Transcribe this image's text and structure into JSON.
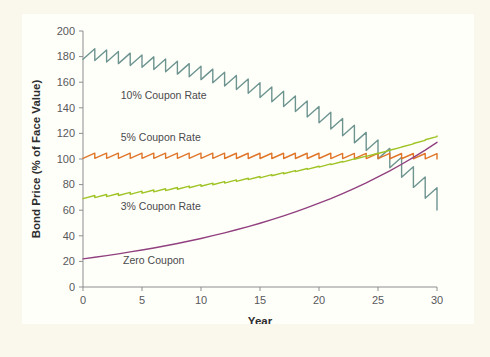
{
  "figure": {
    "background_color": "#faf8ec",
    "panel_color": "#fffffa"
  },
  "chart_data": {
    "type": "line",
    "title": "",
    "subtitle": "",
    "xlabel": "Year",
    "ylabel": "Bond Price (% of Face Value)",
    "xlim": [
      0,
      30
    ],
    "ylim": [
      0,
      200
    ],
    "xticks": [
      0,
      5,
      10,
      15,
      20,
      25,
      30
    ],
    "xtick_labels": [
      "0",
      "5",
      "10",
      "15",
      "20",
      "25",
      "30"
    ],
    "yticks": [
      0,
      20,
      40,
      60,
      80,
      100,
      120,
      140,
      160,
      180,
      200
    ],
    "ytick_labels": [
      "0",
      "20",
      "40",
      "60",
      "80",
      "100",
      "120",
      "140",
      "160",
      "180",
      "200"
    ],
    "grid": false,
    "legend_position": "inline-annotations",
    "annotations": [
      {
        "text": "10% Coupon Rate",
        "x": 3.2,
        "y": 147,
        "series": "10% Coupon Rate"
      },
      {
        "text": "5% Coupon Rate",
        "x": 3.2,
        "y": 114,
        "series": "5% Coupon Rate"
      },
      {
        "text": "3% Coupon Rate",
        "x": 3.2,
        "y": 60,
        "series": "3% Coupon Rate"
      },
      {
        "text": "Zero Coupon",
        "x": 3.4,
        "y": 18,
        "series": "Zero Coupon"
      }
    ],
    "note": "Market yield held constant; sawtooth reflects coupon accrual then drop on each annual coupon payment. All bonds converge to par (100) at maturity in year 30.",
    "market_yield_percent": 5.6,
    "series": [
      {
        "name": "10% Coupon Rate",
        "color": "#6e9490",
        "coupon_rate_percent": 10,
        "sawtooth": true,
        "x": [
          0,
          1,
          2,
          3,
          4,
          5,
          6,
          7,
          8,
          9,
          10,
          11,
          12,
          13,
          14,
          15,
          16,
          17,
          18,
          19,
          20,
          21,
          22,
          23,
          24,
          25,
          26,
          27,
          28,
          29,
          30
        ],
        "values": [
          178.0,
          177.0,
          175.8,
          174.5,
          173.1,
          171.6,
          169.9,
          168.2,
          166.3,
          164.2,
          162.0,
          159.6,
          157.0,
          154.3,
          151.3,
          148.1,
          144.7,
          141.0,
          137.1,
          132.8,
          128.3,
          123.4,
          118.2,
          112.6,
          106.6,
          100.1,
          93.2,
          85.8,
          77.8,
          69.3,
          60.1
        ]
      },
      {
        "name": "5% Coupon Rate",
        "color": "#e0762a",
        "coupon_rate_percent": 5,
        "sawtooth": true,
        "x": [
          0,
          1,
          2,
          3,
          4,
          5,
          6,
          7,
          8,
          9,
          10,
          11,
          12,
          13,
          14,
          15,
          16,
          17,
          18,
          19,
          20,
          21,
          22,
          23,
          24,
          25,
          26,
          27,
          28,
          29,
          30
        ],
        "values": [
          100.5,
          100.5,
          100.5,
          100.5,
          100.5,
          100.5,
          100.5,
          100.5,
          100.5,
          100.5,
          100.5,
          100.5,
          100.4,
          100.4,
          100.4,
          100.4,
          100.4,
          100.4,
          100.4,
          100.4,
          100.4,
          100.3,
          100.3,
          100.3,
          100.3,
          100.3,
          100.2,
          100.2,
          100.2,
          100.1,
          100.0
        ]
      },
      {
        "name": "3% Coupon Rate",
        "color": "#9fc425",
        "coupon_rate_percent": 3,
        "sawtooth": true,
        "x": [
          0,
          1,
          2,
          3,
          4,
          5,
          6,
          7,
          8,
          9,
          10,
          11,
          12,
          13,
          14,
          15,
          16,
          17,
          18,
          19,
          20,
          21,
          22,
          23,
          24,
          25,
          26,
          27,
          28,
          29,
          30
        ],
        "values": [
          69.0,
          69.8,
          70.6,
          71.5,
          72.4,
          73.3,
          74.3,
          75.3,
          76.4,
          77.5,
          78.7,
          79.9,
          81.2,
          82.5,
          83.9,
          85.3,
          86.9,
          88.5,
          90.1,
          91.9,
          93.7,
          95.6,
          97.6,
          99.8,
          102.0,
          104.3,
          106.8,
          109.4,
          112.1,
          115.0,
          118.0
        ]
      },
      {
        "name": "Zero Coupon",
        "color": "#91407f",
        "coupon_rate_percent": 0,
        "sawtooth": false,
        "x": [
          0,
          1,
          2,
          3,
          4,
          5,
          6,
          7,
          8,
          9,
          10,
          11,
          12,
          13,
          14,
          15,
          16,
          17,
          18,
          19,
          20,
          21,
          22,
          23,
          24,
          25,
          26,
          27,
          28,
          29,
          30
        ],
        "values": [
          22.0,
          23.2,
          24.5,
          25.9,
          27.4,
          28.9,
          30.5,
          32.2,
          34.0,
          35.9,
          37.9,
          40.1,
          42.3,
          44.7,
          47.2,
          49.8,
          52.6,
          55.6,
          58.7,
          62.0,
          65.5,
          69.1,
          73.0,
          77.1,
          81.4,
          86.0,
          90.8,
          95.9,
          101.3,
          107.0,
          113.0
        ]
      }
    ]
  }
}
